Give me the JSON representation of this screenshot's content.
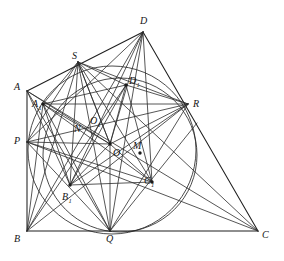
{
  "figure": {
    "background_color": "#ffffff",
    "stroke_color": "#2b2b2b",
    "label_color": "#141414"
  },
  "points": [
    {
      "id": "A",
      "label": "A",
      "sub": "",
      "x": 27,
      "y": 91,
      "label_x": 14,
      "label_y": 82,
      "dot": false
    },
    {
      "id": "A1",
      "label": "A",
      "sub": "1",
      "x": 43,
      "y": 104,
      "label_x": 32,
      "label_y": 99,
      "dot": true
    },
    {
      "id": "B",
      "label": "B",
      "sub": "",
      "x": 27,
      "y": 231,
      "label_x": 14,
      "label_y": 234,
      "dot": false
    },
    {
      "id": "B1",
      "label": "B",
      "sub": "1",
      "x": 70,
      "y": 185,
      "label_x": 62,
      "label_y": 192,
      "dot": true
    },
    {
      "id": "C",
      "label": "C",
      "sub": "",
      "x": 258,
      "y": 231,
      "label_x": 262,
      "label_y": 230,
      "dot": false
    },
    {
      "id": "C1",
      "label": "C",
      "sub": "1",
      "x": 152,
      "y": 182,
      "label_x": 144,
      "label_y": 176,
      "dot": true
    },
    {
      "id": "D",
      "label": "D",
      "sub": "",
      "x": 143,
      "y": 32,
      "label_x": 140,
      "label_y": 16,
      "dot": false
    },
    {
      "id": "D1",
      "label": "D",
      "sub": "1",
      "x": 126,
      "y": 85,
      "label_x": 129,
      "label_y": 76,
      "dot": true
    },
    {
      "id": "P",
      "label": "P",
      "sub": "",
      "x": 27,
      "y": 142,
      "label_x": 14,
      "label_y": 136,
      "dot": false
    },
    {
      "id": "Q",
      "label": "Q",
      "sub": "",
      "x": 110,
      "y": 231,
      "label_x": 106,
      "label_y": 234,
      "dot": false
    },
    {
      "id": "R",
      "label": "R",
      "sub": "",
      "x": 188,
      "y": 104,
      "label_x": 193,
      "label_y": 99,
      "dot": false
    },
    {
      "id": "S",
      "label": "S",
      "sub": "",
      "x": 78,
      "y": 62,
      "label_x": 72,
      "label_y": 51,
      "dot": false
    },
    {
      "id": "O",
      "label": "O",
      "sub": "",
      "x": 110,
      "y": 144,
      "label_x": 113,
      "label_y": 148,
      "dot": true
    },
    {
      "id": "O1",
      "label": "O",
      "sub": "1",
      "x": 101,
      "y": 132,
      "label_x": 90,
      "label_y": 116,
      "dot": false
    },
    {
      "id": "N",
      "label": "N",
      "sub": "",
      "x": 88,
      "y": 137,
      "label_x": 74,
      "label_y": 124,
      "dot": false
    },
    {
      "id": "M",
      "label": "M",
      "sub": "",
      "x": 140,
      "y": 153,
      "label_x": 133,
      "label_y": 141,
      "dot": true
    }
  ],
  "segments": [
    {
      "name": "side-AB",
      "x1": 27,
      "y1": 91,
      "x2": 27,
      "y2": 231,
      "weight": "thick"
    },
    {
      "name": "side-BC",
      "x1": 27,
      "y1": 231,
      "x2": 258,
      "y2": 231,
      "weight": "thick"
    },
    {
      "name": "side-CD",
      "x1": 258,
      "y1": 231,
      "x2": 143,
      "y2": 32,
      "weight": "thick"
    },
    {
      "name": "side-DA",
      "x1": 143,
      "y1": 32,
      "x2": 27,
      "y2": 91,
      "weight": "thick"
    },
    {
      "name": "diag-AC",
      "x1": 27,
      "y1": 91,
      "x2": 258,
      "y2": 231,
      "weight": "thin"
    },
    {
      "name": "diag-BD",
      "x1": 27,
      "y1": 231,
      "x2": 143,
      "y2": 32,
      "weight": "thin"
    },
    {
      "name": "chord-PR",
      "x1": 27,
      "y1": 142,
      "x2": 188,
      "y2": 104,
      "weight": "thin"
    },
    {
      "name": "chord-SQ",
      "x1": 78,
      "y1": 62,
      "x2": 110,
      "y2": 231,
      "weight": "thin"
    },
    {
      "name": "chord-PQ",
      "x1": 27,
      "y1": 142,
      "x2": 110,
      "y2": 231,
      "weight": "thin"
    },
    {
      "name": "chord-PS",
      "x1": 27,
      "y1": 142,
      "x2": 78,
      "y2": 62,
      "weight": "thin"
    },
    {
      "name": "chord-QR",
      "x1": 110,
      "y1": 231,
      "x2": 188,
      "y2": 104,
      "weight": "thin"
    },
    {
      "name": "chord-SR",
      "x1": 78,
      "y1": 62,
      "x2": 188,
      "y2": 104,
      "weight": "thin"
    },
    {
      "name": "quad-A1B1",
      "x1": 43,
      "y1": 104,
      "x2": 70,
      "y2": 185,
      "weight": "thin"
    },
    {
      "name": "quad-B1C1",
      "x1": 70,
      "y1": 185,
      "x2": 152,
      "y2": 182,
      "weight": "thin"
    },
    {
      "name": "quad-C1D1",
      "x1": 152,
      "y1": 182,
      "x2": 126,
      "y2": 85,
      "weight": "thin"
    },
    {
      "name": "quad-D1A1",
      "x1": 126,
      "y1": 85,
      "x2": 43,
      "y2": 104,
      "weight": "thin"
    },
    {
      "name": "diag-A1C1",
      "x1": 43,
      "y1": 104,
      "x2": 152,
      "y2": 182,
      "weight": "thin"
    },
    {
      "name": "diag-B1D1",
      "x1": 70,
      "y1": 185,
      "x2": 126,
      "y2": 85,
      "weight": "thin"
    },
    {
      "name": "ray-D1R",
      "x1": 126,
      "y1": 85,
      "x2": 188,
      "y2": 104,
      "weight": "thin"
    },
    {
      "name": "ray-A1R",
      "x1": 43,
      "y1": 104,
      "x2": 188,
      "y2": 104,
      "weight": "thin"
    },
    {
      "name": "ray-PO",
      "x1": 27,
      "y1": 142,
      "x2": 110,
      "y2": 144,
      "weight": "thin"
    },
    {
      "name": "ray-OQ",
      "x1": 110,
      "y1": 144,
      "x2": 110,
      "y2": 231,
      "weight": "thin"
    },
    {
      "name": "ray-OD",
      "x1": 110,
      "y1": 144,
      "x2": 143,
      "y2": 32,
      "weight": "thin"
    },
    {
      "name": "ray-OS",
      "x1": 110,
      "y1": 144,
      "x2": 78,
      "y2": 62,
      "weight": "thin"
    },
    {
      "name": "ray-OA",
      "x1": 110,
      "y1": 144,
      "x2": 27,
      "y2": 91,
      "weight": "thin"
    },
    {
      "name": "ray-OB1",
      "x1": 110,
      "y1": 144,
      "x2": 70,
      "y2": 185,
      "weight": "thin"
    },
    {
      "name": "ray-OC1",
      "x1": 110,
      "y1": 144,
      "x2": 152,
      "y2": 182,
      "weight": "thin"
    },
    {
      "name": "ray-OD1",
      "x1": 110,
      "y1": 144,
      "x2": 126,
      "y2": 85,
      "weight": "thin"
    },
    {
      "name": "ray-OR",
      "x1": 110,
      "y1": 144,
      "x2": 188,
      "y2": 104,
      "weight": "thin"
    },
    {
      "name": "ray-OA1",
      "x1": 110,
      "y1": 144,
      "x2": 43,
      "y2": 104,
      "weight": "thin"
    },
    {
      "name": "ray-SB1",
      "x1": 78,
      "y1": 62,
      "x2": 70,
      "y2": 185,
      "weight": "thin"
    },
    {
      "name": "ray-SC1",
      "x1": 78,
      "y1": 62,
      "x2": 152,
      "y2": 182,
      "weight": "thin"
    },
    {
      "name": "ray-SD1",
      "x1": 78,
      "y1": 62,
      "x2": 126,
      "y2": 85,
      "weight": "thin"
    },
    {
      "name": "ray-SA1",
      "x1": 78,
      "y1": 62,
      "x2": 43,
      "y2": 104,
      "weight": "thin"
    },
    {
      "name": "ray-DB1",
      "x1": 143,
      "y1": 32,
      "x2": 70,
      "y2": 185,
      "weight": "thin"
    },
    {
      "name": "ray-DQ",
      "x1": 143,
      "y1": 32,
      "x2": 110,
      "y2": 231,
      "weight": "thin"
    },
    {
      "name": "ray-DP",
      "x1": 143,
      "y1": 32,
      "x2": 27,
      "y2": 142,
      "weight": "thin"
    },
    {
      "name": "ray-BD1",
      "x1": 27,
      "y1": 231,
      "x2": 126,
      "y2": 85,
      "weight": "thin"
    },
    {
      "name": "ray-BR",
      "x1": 27,
      "y1": 231,
      "x2": 188,
      "y2": 104,
      "weight": "thin"
    },
    {
      "name": "ray-BA1",
      "x1": 27,
      "y1": 231,
      "x2": 43,
      "y2": 104,
      "weight": "thin"
    },
    {
      "name": "ray-BS",
      "x1": 27,
      "y1": 231,
      "x2": 78,
      "y2": 62,
      "weight": "thin"
    },
    {
      "name": "ray-QC1ext",
      "x1": 110,
      "y1": 231,
      "x2": 197,
      "y2": 123,
      "weight": "thin"
    },
    {
      "name": "ray-PC1",
      "x1": 27,
      "y1": 142,
      "x2": 152,
      "y2": 182,
      "weight": "thin"
    },
    {
      "name": "ray-AQ",
      "x1": 27,
      "y1": 91,
      "x2": 110,
      "y2": 231,
      "weight": "thin"
    },
    {
      "name": "ray-AB1",
      "x1": 27,
      "y1": 91,
      "x2": 70,
      "y2": 185,
      "weight": "thin"
    },
    {
      "name": "ray-SO1N",
      "x1": 78,
      "y1": 62,
      "x2": 110,
      "y2": 144,
      "weight": "thin"
    },
    {
      "name": "ray-A1Q",
      "x1": 43,
      "y1": 104,
      "x2": 110,
      "y2": 231,
      "weight": "thin"
    },
    {
      "name": "ray-B1R",
      "x1": 70,
      "y1": 185,
      "x2": 188,
      "y2": 104,
      "weight": "thin"
    },
    {
      "name": "ray-C1D",
      "x1": 152,
      "y1": 182,
      "x2": 143,
      "y2": 32,
      "weight": "thin"
    },
    {
      "name": "long-PC",
      "x1": 27,
      "y1": 142,
      "x2": 258,
      "y2": 231,
      "weight": "thin"
    },
    {
      "name": "long-SC",
      "x1": 78,
      "y1": 62,
      "x2": 258,
      "y2": 231,
      "weight": "thin"
    }
  ],
  "circles": [
    {
      "name": "outer-circle",
      "cx": 112,
      "cy": 150,
      "r": 84,
      "note": "passes through S, R, Q, B1 region"
    },
    {
      "name": "inner-circle",
      "cx": 120,
      "cy": 155,
      "r": 77,
      "note": "passes near D1, C1, Q and right of R"
    }
  ]
}
